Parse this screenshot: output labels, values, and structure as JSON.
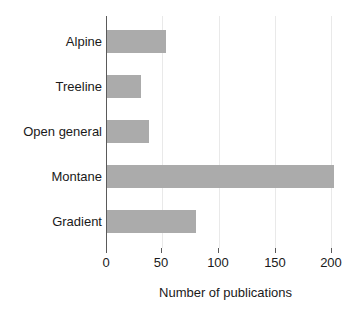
{
  "chart_data": {
    "type": "bar",
    "orientation": "horizontal",
    "title": "",
    "xlabel": "Number of publications",
    "ylabel": "",
    "categories": [
      "Alpine",
      "Treeline",
      "Open general",
      "Montane",
      "Gradient"
    ],
    "values": [
      53,
      31,
      38,
      202,
      80
    ],
    "xlim": [
      0,
      212
    ],
    "xticks": [
      0,
      50,
      100,
      150,
      200
    ],
    "xtick_labels": [
      "0",
      "50",
      "100",
      "150",
      "200"
    ],
    "grid": "vertical-only",
    "legend": "none",
    "bar_color": "#ababab",
    "gridline_color": "#e9e9e9",
    "axis_color": "#5a5a5a",
    "text_color": "#1a1a1a"
  },
  "axis": {
    "x_title": "Number of publications"
  }
}
